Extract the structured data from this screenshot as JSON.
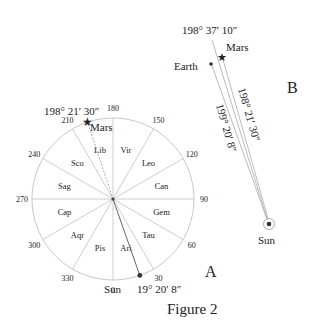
{
  "figure": {
    "caption": "Figure 2"
  },
  "panel_a": {
    "label": "A",
    "center": [
      113,
      199
    ],
    "radius": 81,
    "line_color": "#c8c8c8",
    "degree_ticks": [
      "0",
      "30",
      "60",
      "90",
      "120",
      "150",
      "180",
      "210",
      "240",
      "270",
      "300",
      "330"
    ],
    "signs": [
      "Ari",
      "Tau",
      "Gem",
      "Can",
      "Leo",
      "Vir",
      "Lib",
      "Sco",
      "Sag",
      "Cap",
      "Aqr",
      "Pis"
    ],
    "mars": {
      "label": "Mars",
      "longitude": "198° 21′ 30″",
      "longitude_deg": 198.358
    },
    "sun": {
      "label": "Sun",
      "longitude": "19° 20′ 8″",
      "longitude_deg": 19.336
    }
  },
  "panel_b": {
    "label": "B",
    "earth_label": "Earth",
    "mars_label": "Mars",
    "sun_label": "Sun",
    "line_top_label": "198° 37′ 10″",
    "line_mars_label": "198° 21′ 30″",
    "line_earth_label": "199° 20′ 8″"
  }
}
